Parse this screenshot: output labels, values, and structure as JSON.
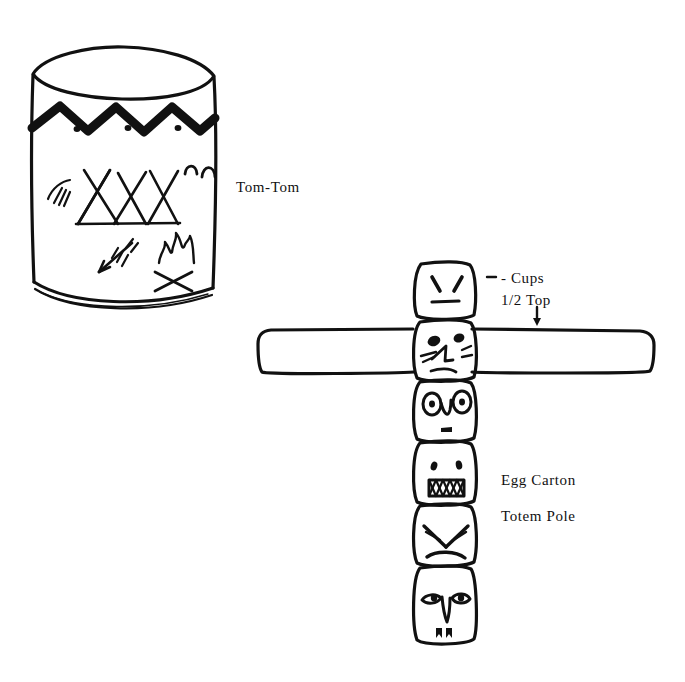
{
  "page": {
    "background_color": "#ffffff",
    "ink_color": "#111111",
    "width": 685,
    "height": 682
  },
  "labels": {
    "tom_tom": "Tom-Tom",
    "cups": "- Cups",
    "half_top": "1/2 Top",
    "egg_carton": "Egg Carton",
    "totem_pole": "Totem Pole"
  },
  "tom_tom": {
    "name": "Tom-Tom",
    "description": "Cylindrical hand-drawn drum with decorated side",
    "decorations": [
      "zigzag-band",
      "zigzag-dots",
      "three-teepees",
      "two-hills",
      "feather-marks",
      "arrow",
      "campfire"
    ],
    "zigzag_peaks": 6,
    "zigzag_dots": 3,
    "teepee_count": 3,
    "hill_count": 2
  },
  "totem_pole": {
    "name": "Egg Carton Totem Pole",
    "block_count": 6,
    "has_wings": true,
    "wing_block_index": 2,
    "blocks": [
      {
        "index": 1,
        "face": "angled-brow-eyes-straight-mouth"
      },
      {
        "index": 2,
        "face": "oval-eyes-nose-whiskers-frown"
      },
      {
        "index": 3,
        "face": "ringed-eyes-v-nose-small-mouth"
      },
      {
        "index": 4,
        "face": "dot-eyes-toothy-zigzag-mouth"
      },
      {
        "index": 5,
        "face": "angry-v-brows-frowning-mouth"
      },
      {
        "index": 6,
        "face": "almond-eyes-long-nose-fangs"
      }
    ]
  },
  "annotations": {
    "cups_leader": "dash-leader-line",
    "half_top_arrow": "down-arrow"
  }
}
